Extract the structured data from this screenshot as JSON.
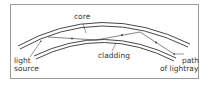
{
  "diagram": {
    "labels": {
      "core": "core",
      "cladding": "cladding",
      "light_source_line1": "light",
      "light_source_line2": "source",
      "path_line1": "path",
      "path_line2": "of lightray"
    },
    "colors": {
      "line": "#333333",
      "border": "#9a9a9a",
      "background": "#ffffff"
    }
  }
}
